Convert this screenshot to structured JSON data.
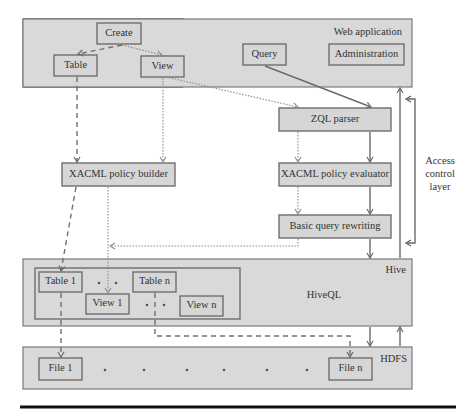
{
  "layers": {
    "web_application": "Web application",
    "hive": "Hive",
    "hdfs": "HDFS",
    "access_control": [
      "Access",
      "control",
      "layer"
    ]
  },
  "web_app": {
    "create": "Create",
    "table": "Table",
    "view": "View",
    "query": "Query",
    "administration": "Administration"
  },
  "access_layer": {
    "zql_parser": "ZQL parser",
    "policy_builder": "XACML policy builder",
    "policy_evaluator": "XACML policy evaluator",
    "query_rewriting": "Basic query rewriting"
  },
  "hive": {
    "table_1": "Table 1",
    "table_n": "Table n",
    "view_1": "View 1",
    "view_n": "View n",
    "hiveql": "HiveQL"
  },
  "hdfs": {
    "file_1": "File 1",
    "file_n": "File n"
  },
  "colors": {
    "layer_fill": "#d9d9d9",
    "box_fill": "#d6d6d6",
    "border": "#6e6e6e"
  }
}
